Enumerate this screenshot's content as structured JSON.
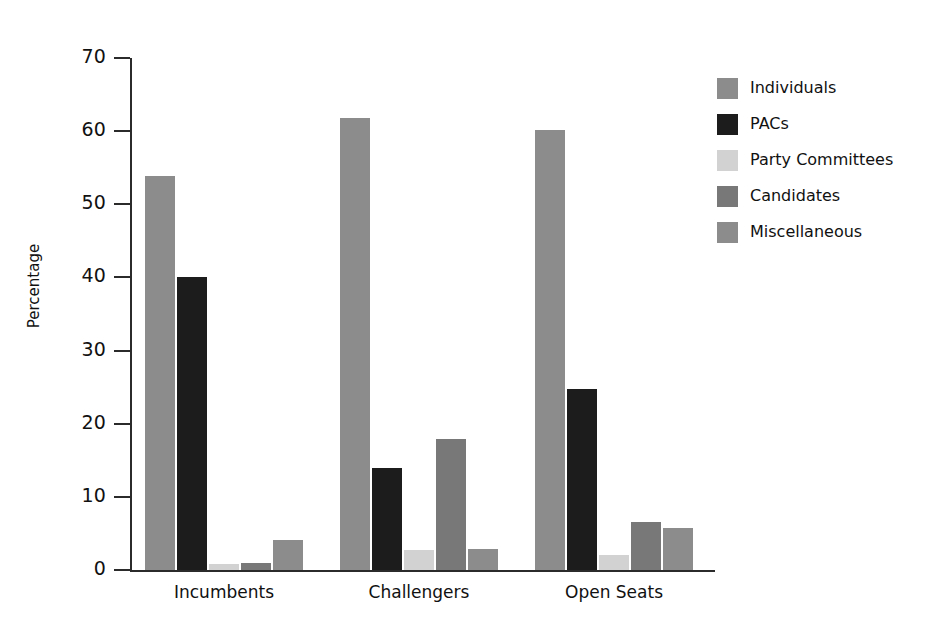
{
  "chart_data": {
    "type": "bar",
    "title": "",
    "xlabel": "",
    "ylabel": "Percentage",
    "ylim": [
      0,
      70
    ],
    "yticks": [
      0,
      10,
      20,
      30,
      40,
      50,
      60,
      70
    ],
    "ytick_labels": [
      "0",
      "10",
      "20",
      "30",
      "40",
      "50",
      "60",
      "70"
    ],
    "grid": false,
    "legend_position": "right",
    "categories": [
      "Incumbents",
      "Challengers",
      "Open Seats"
    ],
    "series": [
      {
        "name": "Individuals",
        "color": "#8c8c8c",
        "values": [
          53.9,
          61.8,
          60.1
        ]
      },
      {
        "name": "PACs",
        "color": "#1c1c1c",
        "values": [
          40.1,
          14.0,
          24.8
        ]
      },
      {
        "name": "Party Committees",
        "color": "#d2d2d2",
        "values": [
          0.8,
          2.7,
          2.0
        ]
      },
      {
        "name": "Candidates",
        "color": "#787878",
        "values": [
          0.9,
          17.9,
          6.6
        ]
      },
      {
        "name": "Miscellaneous",
        "color": "#8c8c8c",
        "values": [
          4.1,
          2.9,
          5.8
        ]
      }
    ]
  },
  "legend": {
    "items": [
      {
        "label": "Individuals"
      },
      {
        "label": "PACs"
      },
      {
        "label": "Party Committees"
      },
      {
        "label": "Candidates"
      },
      {
        "label": "Miscellaneous"
      }
    ]
  },
  "axis": {
    "y_title": "Percentage"
  },
  "colors": {
    "axis": "#2b2b2b",
    "text": "#111111",
    "background": "#ffffff"
  }
}
